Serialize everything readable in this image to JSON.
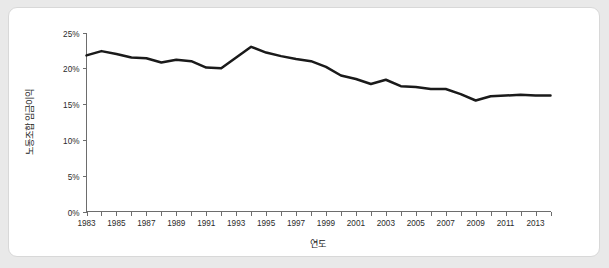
{
  "chart_data": {
    "type": "line",
    "title": "",
    "xlabel": "연도",
    "ylabel": "노동조합 임금이익",
    "xlim": [
      1983,
      2014
    ],
    "ylim": [
      0,
      25
    ],
    "grid": false,
    "legend": null,
    "y_tick_labels": [
      "0%",
      "5%",
      "10%",
      "15%",
      "20%",
      "25%"
    ],
    "y_tick_values": [
      0,
      5,
      10,
      15,
      20,
      25
    ],
    "x_tick_labels": [
      "1983",
      "1985",
      "1987",
      "1989",
      "1991",
      "1993",
      "1995",
      "1997",
      "1999",
      "2001",
      "2003",
      "2005",
      "2007",
      "2009",
      "2011",
      "2013"
    ],
    "x_tick_values": [
      1983,
      1985,
      1987,
      1989,
      1991,
      1993,
      1995,
      1997,
      1999,
      2001,
      2003,
      2005,
      2007,
      2009,
      2011,
      2013
    ],
    "x_minor_tick_values": [
      1984,
      1986,
      1988,
      1990,
      1992,
      1994,
      1996,
      1998,
      2000,
      2002,
      2004,
      2006,
      2008,
      2010,
      2012,
      2014
    ],
    "series": [
      {
        "name": "노동조합 임금이익",
        "color": "#1a1a1a",
        "x": [
          1983,
          1984,
          1985,
          1986,
          1987,
          1988,
          1989,
          1990,
          1991,
          1992,
          1993,
          1994,
          1995,
          1996,
          1997,
          1998,
          1999,
          2000,
          2001,
          2002,
          2003,
          2004,
          2005,
          2006,
          2007,
          2008,
          2009,
          2010,
          2011,
          2012,
          2013,
          2014
        ],
        "values": [
          21.8,
          22.4,
          22.0,
          21.5,
          21.4,
          20.8,
          21.2,
          21.0,
          20.1,
          20.0,
          21.5,
          23.0,
          22.2,
          21.7,
          21.3,
          21.0,
          20.2,
          19.0,
          18.5,
          17.8,
          18.4,
          17.5,
          17.4,
          17.1,
          17.1,
          16.4,
          15.5,
          16.1,
          16.2,
          16.3,
          16.2,
          16.2
        ]
      }
    ]
  },
  "axes": {
    "y_axis_title": "노동조합 임금이익",
    "x_axis_title": "연도"
  }
}
